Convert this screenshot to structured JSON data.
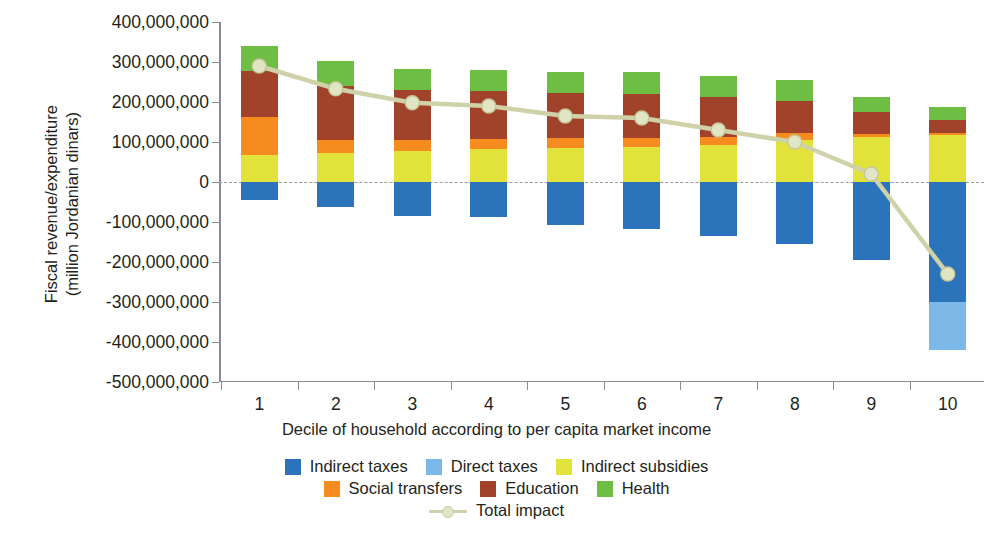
{
  "chart_data": {
    "type": "bar",
    "subtype": "stacked-bar-with-line",
    "title": "",
    "xlabel": "Decile of household according to per capita market income",
    "ylabel": "Fiscal revenue/expenditure\n(million Jordanian dinars)",
    "categories": [
      "1",
      "2",
      "3",
      "4",
      "5",
      "6",
      "7",
      "8",
      "9",
      "10"
    ],
    "ylim": [
      -500000000,
      400000000
    ],
    "ytick_labels": [
      "400,000,000",
      "300,000,000",
      "200,000,000",
      "100,000,000",
      "0",
      "-100,000,000",
      "-200,000,000",
      "-300,000,000",
      "-400,000,000",
      "-500,000,000"
    ],
    "ytick_values": [
      400000000,
      300000000,
      200000000,
      100000000,
      0,
      -100000000,
      -200000000,
      -300000000,
      -400000000,
      -500000000
    ],
    "grid": false,
    "zero_line": true,
    "legend_position": "bottom",
    "series": [
      {
        "name": "Indirect taxes",
        "color": "#2b74bc",
        "values": [
          -45000000,
          -63000000,
          -85000000,
          -87000000,
          -107000000,
          -118000000,
          -135000000,
          -155000000,
          -195000000,
          -300000000
        ]
      },
      {
        "name": "Direct taxes",
        "color": "#7cb9e8",
        "values": [
          0,
          0,
          0,
          0,
          0,
          0,
          0,
          0,
          0,
          -120000000
        ]
      },
      {
        "name": "Indirect subsidies",
        "color": "#e2e33a",
        "values": [
          68000000,
          72000000,
          78000000,
          82000000,
          86000000,
          88000000,
          92000000,
          106000000,
          112000000,
          118000000
        ]
      },
      {
        "name": "Social transfers",
        "color": "#f68b1f",
        "values": [
          95000000,
          32000000,
          28000000,
          26000000,
          24000000,
          22000000,
          20000000,
          16000000,
          8000000,
          4000000
        ]
      },
      {
        "name": "Education",
        "color": "#a0432a",
        "values": [
          115000000,
          135000000,
          125000000,
          120000000,
          112000000,
          110000000,
          100000000,
          80000000,
          55000000,
          32000000
        ]
      },
      {
        "name": "Health",
        "color": "#6ebe44",
        "values": [
          62000000,
          63000000,
          51000000,
          52000000,
          52000000,
          55000000,
          53000000,
          53000000,
          38000000,
          34000000
        ]
      }
    ],
    "line_series": {
      "name": "Total impact",
      "color": "#cfd1a8",
      "marker_color": "#e2e5c4",
      "values": [
        290000000,
        233000000,
        198000000,
        190000000,
        165000000,
        160000000,
        130000000,
        100000000,
        20000000,
        -230000000
      ]
    }
  },
  "legend": {
    "rows": [
      [
        {
          "label": "Indirect taxes",
          "color": "#2b74bc",
          "kind": "swatch"
        },
        {
          "label": "Direct taxes",
          "color": "#7cb9e8",
          "kind": "swatch"
        },
        {
          "label": "Indirect subsidies",
          "color": "#e2e33a",
          "kind": "swatch"
        }
      ],
      [
        {
          "label": "Social transfers",
          "color": "#f68b1f",
          "kind": "swatch"
        },
        {
          "label": "Education",
          "color": "#a0432a",
          "kind": "swatch"
        },
        {
          "label": "Health",
          "color": "#6ebe44",
          "kind": "swatch"
        }
      ],
      [
        {
          "label": "Total impact",
          "color": "#cfd1a8",
          "kind": "line"
        }
      ]
    ]
  }
}
